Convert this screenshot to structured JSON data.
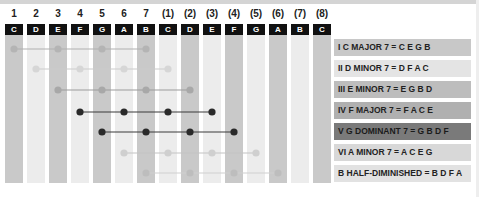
{
  "diagram": {
    "degree_numbers": [
      "1",
      "2",
      "3",
      "4",
      "5",
      "6",
      "7",
      "(1)",
      "(2)",
      "(3)",
      "(4)",
      "(5)",
      "(6)",
      "(7)",
      "(8)"
    ],
    "notes": [
      "C",
      "D",
      "E",
      "F",
      "G",
      "A",
      "B",
      "C",
      "D",
      "E",
      "F",
      "G",
      "A",
      "B",
      "C"
    ],
    "column_shading": [
      "dark",
      "light",
      "dark",
      "light",
      "dark",
      "light",
      "dark",
      "light",
      "dark",
      "light",
      "dark",
      "light",
      "dark",
      "light",
      "dark"
    ],
    "chords": [
      {
        "label": "I C MAJOR 7 = C E G B",
        "columns": [
          0,
          2,
          4,
          6
        ],
        "dot_color": "#b4b4b4",
        "line_color": "#b0b0b0",
        "label_bg": "#c8c8c8"
      },
      {
        "label": "II D MINOR 7 = D F A C",
        "columns": [
          1,
          3,
          5,
          7
        ],
        "dot_color": "#d6d6d6",
        "line_color": "#cccccc",
        "label_bg": "#e4e4e4"
      },
      {
        "label": "III E MINOR 7 = E G B D",
        "columns": [
          2,
          4,
          6,
          8
        ],
        "dot_color": "#a8a8a8",
        "line_color": "#9c9c9c",
        "label_bg": "#bdbdbd"
      },
      {
        "label": "IV F MAJOR 7 = F A C E",
        "columns": [
          3,
          5,
          7,
          9
        ],
        "dot_color": "#2a2a2a",
        "line_color": "#3a3a3a",
        "label_bg": "#b0b0b0"
      },
      {
        "label": "V G DOMINANT 7 = G B D F",
        "columns": [
          4,
          6,
          8,
          10
        ],
        "dot_color": "#2a2a2a",
        "line_color": "#3a3a3a",
        "label_bg": "#7a7a7a"
      },
      {
        "label": "VI A MINOR 7 = A C E G",
        "columns": [
          5,
          7,
          9,
          11
        ],
        "dot_color": "#cfcfcf",
        "line_color": "#c4c4c4",
        "label_bg": "#d8d8d8"
      },
      {
        "label": "B HALF-DIMINISHED = B D F A",
        "columns": [
          6,
          8,
          10,
          12
        ],
        "dot_color": "#bdbdbd",
        "line_color": "#cfcfcf",
        "label_bg": "#e2e2e2"
      }
    ]
  }
}
